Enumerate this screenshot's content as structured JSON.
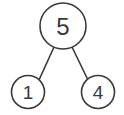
{
  "diagram": {
    "type": "binary-tree",
    "background_color": "#ffffff",
    "stroke_color": "#3a3a3a",
    "node_fill_color": "#ffffff",
    "nodes": [
      {
        "id": "root",
        "label": "5",
        "role": "root",
        "cx": 63,
        "cy": 26,
        "r": 23
      },
      {
        "id": "left-child",
        "label": "1",
        "role": "leaf",
        "cx": 28,
        "cy": 92,
        "r": 16.5
      },
      {
        "id": "right-child",
        "label": "4",
        "role": "leaf",
        "cx": 98,
        "cy": 92,
        "r": 16.5
      }
    ],
    "edges": [
      {
        "id": "root-to-left",
        "from": "root",
        "to": "left-child",
        "x1": 54,
        "y1": 47,
        "x2": 39,
        "y2": 80
      },
      {
        "id": "root-to-right",
        "from": "root",
        "to": "right-child",
        "x1": 72,
        "y1": 47,
        "x2": 88,
        "y2": 80
      }
    ]
  }
}
